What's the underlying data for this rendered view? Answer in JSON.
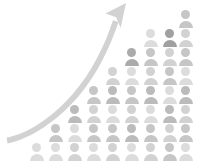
{
  "graphic": {
    "title": "Population growth pictogram",
    "description": "Staircase arrangement of person icons rising left to right with a curved upward arrow",
    "background_color": "#ffffff",
    "canvas": {
      "width": 197,
      "height": 167
    }
  },
  "arrow": {
    "name": "upward-growth-arrow",
    "color": "#d2d2d2",
    "stroke_color": "#cbcbcb",
    "tail_point": {
      "x": 7,
      "y": 143
    },
    "tip_point": {
      "x": 126,
      "y": 3
    },
    "direction": "up-right",
    "shape": "curved"
  },
  "icon": {
    "name": "person-icon",
    "head_shape": "circle",
    "body_shape": "semicircle",
    "cell_width": 19,
    "cell_height": 19,
    "icon_width": 15,
    "icon_height": 17
  },
  "palette": {
    "light": "#dcdcdc",
    "light_mid": "#d2d2d2",
    "mid": "#c6c6c6",
    "mid_dark": "#bbbbbb",
    "dark": "#ababab",
    "darkest": "#a0a0a0"
  },
  "chart_data": {
    "type": "bar",
    "subtitle": "",
    "xlabel": "",
    "ylabel": "",
    "unit": "1 icon = 1 person",
    "categories": [
      "1",
      "2",
      "3",
      "4",
      "5",
      "6",
      "7",
      "8",
      "9"
    ],
    "values": [
      1,
      2,
      3,
      4,
      5,
      6,
      7,
      7,
      8
    ],
    "ylim": [
      0,
      8
    ],
    "grid": false,
    "legend": false,
    "annotations": [
      {
        "name": "growth-arrow",
        "text": "",
        "from": [
          7,
          143
        ],
        "to": [
          126,
          3
        ]
      }
    ]
  },
  "columns": [
    {
      "index": 0,
      "x": 37,
      "count": 1,
      "shades": [
        "light"
      ]
    },
    {
      "index": 1,
      "x": 56,
      "count": 2,
      "shades": [
        "light",
        "mid"
      ]
    },
    {
      "index": 2,
      "x": 75,
      "count": 3,
      "shades": [
        "light_mid",
        "light",
        "mid_dark"
      ]
    },
    {
      "index": 3,
      "x": 94,
      "count": 4,
      "shades": [
        "light",
        "mid",
        "light_mid",
        "mid"
      ]
    },
    {
      "index": 4,
      "x": 113,
      "count": 5,
      "shades": [
        "light_mid",
        "mid",
        "light",
        "mid_dark",
        "light_mid"
      ]
    },
    {
      "index": 5,
      "x": 132,
      "count": 6,
      "shades": [
        "light",
        "mid_dark",
        "light_mid",
        "mid",
        "light",
        "dark"
      ]
    },
    {
      "index": 6,
      "x": 151,
      "count": 7,
      "shades": [
        "light_mid",
        "mid",
        "light",
        "mid_dark",
        "light_mid",
        "mid",
        "light"
      ]
    },
    {
      "index": 7,
      "x": 170,
      "count": 7,
      "shades": [
        "mid",
        "light_mid",
        "mid_dark",
        "light",
        "mid",
        "light_mid",
        "darkest"
      ]
    },
    {
      "index": 8,
      "x": 186,
      "count": 8,
      "shades": [
        "light",
        "mid",
        "light_mid",
        "mid_dark",
        "light",
        "mid",
        "light_mid",
        "mid"
      ]
    }
  ]
}
